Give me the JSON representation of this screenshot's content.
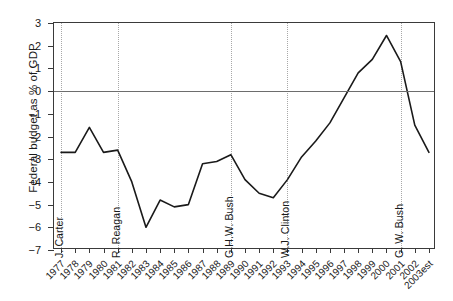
{
  "chart_data": {
    "type": "line",
    "title": "",
    "xlabel": "",
    "ylabel": "Federal budget as % of GDP",
    "ylim": [
      -7,
      3
    ],
    "yticks": [
      3,
      2,
      1,
      0,
      -1,
      -2,
      -3,
      -4,
      -5,
      -6,
      -7
    ],
    "ytick_labels": [
      "3",
      "2",
      "1",
      "0",
      "−1",
      "−2",
      "−3",
      "−4",
      "−5",
      "−6",
      "−7"
    ],
    "grid": false,
    "zero_line": true,
    "legend": "none",
    "line_color": "#1a1a1a",
    "categories": [
      "1977",
      "1978",
      "1979",
      "1980",
      "1981",
      "1982",
      "1983",
      "1984",
      "1985",
      "1986",
      "1987",
      "1988",
      "1989",
      "1990",
      "1991",
      "1992",
      "1993",
      "1994",
      "1995",
      "1996",
      "1997",
      "1998",
      "1999",
      "2000",
      "2001",
      "2002",
      "2003est"
    ],
    "values": [
      -2.7,
      -2.7,
      -1.6,
      -2.7,
      -2.6,
      -4.0,
      -6.0,
      -4.8,
      -5.1,
      -5.0,
      -3.2,
      -3.1,
      -2.8,
      -3.9,
      -4.5,
      -4.7,
      -3.9,
      -2.9,
      -2.2,
      -1.4,
      -0.3,
      0.8,
      1.4,
      2.45,
      1.3,
      -1.5,
      -2.7
    ],
    "annotations": [
      {
        "label": "J. Carter",
        "x": "1977"
      },
      {
        "label": "R. Reagan",
        "x": "1981"
      },
      {
        "label": "G.H.W. Bush",
        "x": "1989"
      },
      {
        "label": "W.J. Clinton",
        "x": "1993"
      },
      {
        "label": "G. W. Bush",
        "x": "2001"
      }
    ]
  }
}
